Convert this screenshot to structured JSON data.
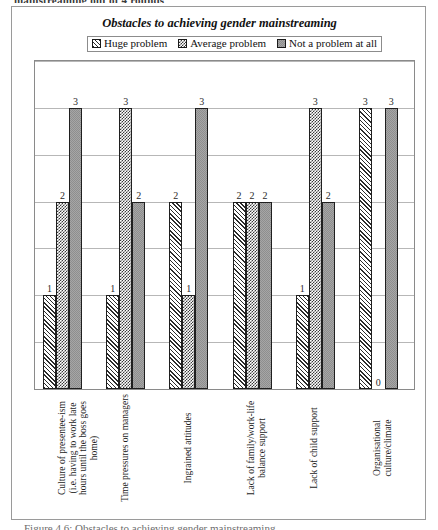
{
  "document": {
    "top_caption": "mainstreaming out of 4 rounds",
    "bottom_caption": "Figure 4.6:  Obstacles to achieving gender mainstreaming"
  },
  "chart": {
    "title": "Obstacles to achieving gender mainstreaming",
    "legend": [
      {
        "label": "Huge problem",
        "pattern": "diagonal-hatch"
      },
      {
        "label": "Average problem",
        "pattern": "checkerboard"
      },
      {
        "label": "Not a problem at all",
        "pattern": "solid-gray"
      }
    ]
  },
  "chart_data": {
    "type": "bar",
    "title": "Obstacles to achieving gender mainstreaming",
    "xlabel": "",
    "ylabel": "",
    "ylim": [
      0,
      3.5
    ],
    "yticks": [
      0,
      0.5,
      1,
      1.5,
      2,
      2.5,
      3,
      3.5
    ],
    "grid": true,
    "legend_position": "top",
    "categories": [
      "Culture of presentee-ism (i.e. having to work late hours until the boss goes home)",
      "Time pressures on managers",
      "Ingrained attitudes",
      "Lack of family/work-life balance support",
      "Lack of child support",
      "Organisational culture/climate"
    ],
    "series": [
      {
        "name": "Huge problem",
        "values": [
          1,
          1,
          2,
          2,
          1,
          3
        ]
      },
      {
        "name": "Average problem",
        "values": [
          2,
          3,
          1,
          2,
          3,
          0
        ]
      },
      {
        "name": "Not a problem at all",
        "values": [
          3,
          2,
          3,
          2,
          2,
          3
        ]
      }
    ],
    "data_labels": [
      [
        "1",
        "2",
        "3"
      ],
      [
        "1",
        "3",
        "2"
      ],
      [
        "2",
        "1",
        "3"
      ],
      [
        "2",
        "2",
        "2"
      ],
      [
        "1",
        "3",
        "2"
      ],
      [
        "3",
        "0",
        "3"
      ]
    ]
  }
}
